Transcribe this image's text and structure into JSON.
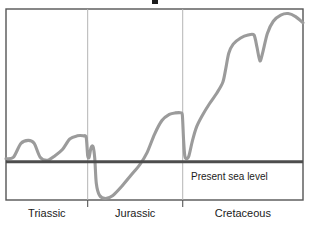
{
  "chart_data": {
    "type": "line",
    "title": "",
    "subtitle": "",
    "xlabel": "",
    "ylabel": "",
    "grid": false,
    "legend_position": "none",
    "xlim": [
      0,
      100
    ],
    "ylim": [
      -25,
      100
    ],
    "axis": {
      "periods": [
        {
          "name": "Triassic",
          "start": 0,
          "end": 27.5
        },
        {
          "name": "Jurassic",
          "start": 27.5,
          "end": 59.5
        },
        {
          "name": "Cretaceous",
          "start": 59.5,
          "end": 100
        }
      ],
      "boundaries": [
        27.5,
        59.5
      ]
    },
    "reference_lines": [
      {
        "name": "present-sea-level",
        "label": "Present sea level",
        "y_value": 0,
        "color": "#4d4d4d"
      }
    ],
    "series": [
      {
        "name": "Relative sea level",
        "color": "#9b9b9b",
        "points": [
          {
            "x": 0.0,
            "y": 2
          },
          {
            "x": 2.5,
            "y": 3
          },
          {
            "x": 5.0,
            "y": 12
          },
          {
            "x": 7.5,
            "y": 14
          },
          {
            "x": 9.5,
            "y": 12
          },
          {
            "x": 11.5,
            "y": 3
          },
          {
            "x": 14.0,
            "y": 1
          },
          {
            "x": 16.5,
            "y": 4
          },
          {
            "x": 19.0,
            "y": 8
          },
          {
            "x": 21.5,
            "y": 15
          },
          {
            "x": 24.0,
            "y": 17
          },
          {
            "x": 26.0,
            "y": 17
          },
          {
            "x": 27.0,
            "y": 16
          },
          {
            "x": 27.5,
            "y": 4
          },
          {
            "x": 28.0,
            "y": 3
          },
          {
            "x": 28.6,
            "y": 9
          },
          {
            "x": 29.3,
            "y": 10
          },
          {
            "x": 29.9,
            "y": 2
          },
          {
            "x": 30.4,
            "y": -14
          },
          {
            "x": 31.5,
            "y": -22
          },
          {
            "x": 33.5,
            "y": -24
          },
          {
            "x": 36.0,
            "y": -22
          },
          {
            "x": 39.0,
            "y": -16
          },
          {
            "x": 42.0,
            "y": -9
          },
          {
            "x": 45.0,
            "y": -2
          },
          {
            "x": 47.5,
            "y": 6
          },
          {
            "x": 50.0,
            "y": 18
          },
          {
            "x": 52.5,
            "y": 27
          },
          {
            "x": 55.0,
            "y": 31
          },
          {
            "x": 57.0,
            "y": 32
          },
          {
            "x": 59.0,
            "y": 32
          },
          {
            "x": 59.4,
            "y": 30
          },
          {
            "x": 59.8,
            "y": 14
          },
          {
            "x": 60.2,
            "y": 4
          },
          {
            "x": 60.8,
            "y": 2
          },
          {
            "x": 61.6,
            "y": 4
          },
          {
            "x": 62.8,
            "y": 14
          },
          {
            "x": 64.2,
            "y": 23
          },
          {
            "x": 66.0,
            "y": 30
          },
          {
            "x": 68.5,
            "y": 38
          },
          {
            "x": 71.0,
            "y": 45
          },
          {
            "x": 73.0,
            "y": 52
          },
          {
            "x": 74.0,
            "y": 61
          },
          {
            "x": 75.0,
            "y": 71
          },
          {
            "x": 76.5,
            "y": 77
          },
          {
            "x": 79.0,
            "y": 81
          },
          {
            "x": 81.5,
            "y": 83
          },
          {
            "x": 83.5,
            "y": 83
          },
          {
            "x": 84.5,
            "y": 75
          },
          {
            "x": 85.5,
            "y": 66
          },
          {
            "x": 86.5,
            "y": 72
          },
          {
            "x": 88.0,
            "y": 84
          },
          {
            "x": 90.0,
            "y": 92
          },
          {
            "x": 92.5,
            "y": 96
          },
          {
            "x": 95.0,
            "y": 97
          },
          {
            "x": 97.5,
            "y": 95
          },
          {
            "x": 100.0,
            "y": 91
          }
        ]
      }
    ]
  },
  "frame": {
    "border_color": "#555555",
    "divider_color": "#b4b4b4",
    "background": "#ffffff"
  },
  "labels": {
    "sea_level": "Present sea level",
    "period_triassic": "Triassic",
    "period_jurassic": "Jurassic",
    "period_cretaceous": "Cretaceous"
  }
}
